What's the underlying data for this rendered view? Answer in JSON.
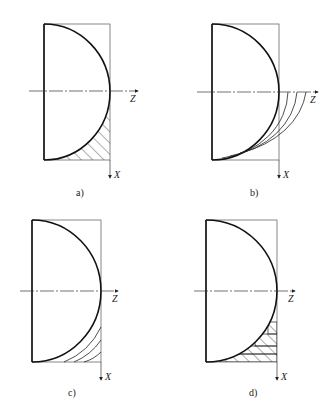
{
  "figure": {
    "panels": [
      {
        "id": "a",
        "caption": "a)",
        "z_axis_label": "Z",
        "x_axis_label": "X",
        "description": "hemispherical profile with diagonal hatched residual region below axis"
      },
      {
        "id": "b",
        "caption": "b)",
        "z_axis_label": "Z",
        "x_axis_label": "X",
        "description": "hemispherical profile with successive offset arc passes"
      },
      {
        "id": "c",
        "caption": "c)",
        "z_axis_label": "Z",
        "x_axis_label": "X",
        "description": "hemispherical profile with concentric arc passes in lower corner"
      },
      {
        "id": "d",
        "caption": "d)",
        "z_axis_label": "Z",
        "x_axis_label": "X",
        "description": "hemispherical profile with stepped horizontal layered hatched passes"
      }
    ]
  }
}
